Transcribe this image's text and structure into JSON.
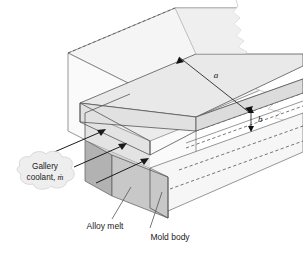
{
  "figure": {
    "type": "engineering-diagram"
  },
  "labels": {
    "gallery_coolant_line1": "Gallery",
    "gallery_coolant_line2": "coolant, ",
    "gallery_coolant_symbol": "ṁ",
    "alloy_melt": "Alloy melt",
    "mold_body": "Mold body"
  },
  "dimensions": {
    "length_symbol": "a",
    "thickness_symbol": "b"
  },
  "colors": {
    "mold_body_face": "#f2f2f2",
    "mold_body_face_light": "#f7f7f7",
    "slab_top": "#e7e7e7",
    "slab_front": "#ededed",
    "slab_side": "#e0e0e0",
    "alloy_melt_front": "#c6c6c6",
    "alloy_melt_side": "#b0b0b0",
    "gallery_shadow": "#d8d8d8",
    "outline": "#555555",
    "hidden_edge": "#555555",
    "arrow": "#1a1a1a",
    "text": "#1a1a1a",
    "callout_fill": "#eeeeee",
    "callout_stroke": "#d0d0d0",
    "background": "#ffffff"
  },
  "flow_arrows": {
    "count": 3,
    "direction": "into-gallery-up-right",
    "description": "coolant mass flow entering the gallery"
  },
  "leaders": [
    {
      "name": "alloy-melt-leader",
      "target": "alloy melt side face"
    },
    {
      "name": "mold-body-leader",
      "target": "mold body front corner"
    },
    {
      "name": "gallery-coolant-leader",
      "target": "gallery inlet arrows"
    }
  ]
}
